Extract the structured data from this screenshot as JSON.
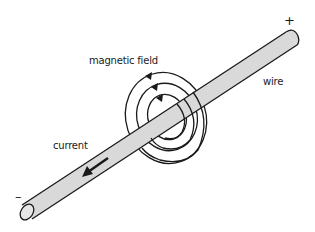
{
  "diagram": {
    "labels": {
      "magnetic_field": "magnetic field",
      "wire": "wire",
      "current": "current",
      "positive_terminal": "+",
      "negative_terminal": "–"
    },
    "elements": {
      "wire": {
        "from": [
          27,
          212
        ],
        "to": [
          292,
          38
        ],
        "fill": "#d9d9d9",
        "stroke": "#1a1a1a"
      },
      "field_loops": [
        {
          "name": "outer",
          "cx": 166,
          "cy": 118,
          "rx": 40,
          "ry": 46
        },
        {
          "name": "middle",
          "cx": 167,
          "cy": 117,
          "rx": 30,
          "ry": 34
        },
        {
          "name": "inner",
          "cx": 167,
          "cy": 117,
          "rx": 19,
          "ry": 23
        }
      ],
      "field_direction": "counterclockwise",
      "current_direction": "toward negative end (lower-left)"
    },
    "colors": {
      "background": "#ffffff",
      "line": "#1a1a1a",
      "wire_fill": "#d9d9d9"
    }
  }
}
